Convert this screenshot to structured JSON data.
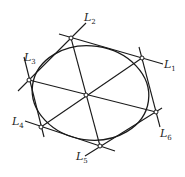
{
  "diagram": {
    "type": "brianchon-hexagon",
    "colors": {
      "line": "#1a1a1a",
      "background": "#ffffff",
      "vertex_fill": "#ffffff"
    },
    "ellipse": {
      "cx": 90.5,
      "cy": 93,
      "rx": 58.5,
      "ry": 47,
      "rotate": 8
    },
    "center": {
      "x": 86,
      "y": 95
    },
    "vertices": [
      {
        "id": "A",
        "x": 71,
        "y": 38
      },
      {
        "id": "B",
        "x": 142,
        "y": 58
      },
      {
        "id": "C",
        "x": 156,
        "y": 112
      },
      {
        "id": "D",
        "x": 100,
        "y": 146
      },
      {
        "id": "E",
        "x": 41,
        "y": 127
      },
      {
        "id": "F",
        "x": 29,
        "y": 80
      }
    ],
    "tangent_lines": [
      {
        "name": "L1",
        "x1": 59,
        "y1": 34,
        "x2": 163,
        "y2": 64
      },
      {
        "name": "L2",
        "x1": 18,
        "y1": 91,
        "x2": 86,
        "y2": 23
      },
      {
        "name": "L3",
        "x1": 24,
        "y1": 57,
        "x2": 44,
        "y2": 137
      },
      {
        "name": "L4",
        "x1": 25,
        "y1": 121,
        "x2": 115,
        "y2": 151
      },
      {
        "name": "L5",
        "x1": 85,
        "y1": 156,
        "x2": 162,
        "y2": 108
      },
      {
        "name": "L6",
        "x1": 139,
        "y1": 47,
        "x2": 160,
        "y2": 127
      }
    ],
    "diagonals": [
      {
        "x1": 71,
        "y1": 38,
        "x2": 100,
        "y2": 146
      },
      {
        "x1": 142,
        "y1": 58,
        "x2": 41,
        "y2": 127
      },
      {
        "x1": 29,
        "y1": 80,
        "x2": 156,
        "y2": 112
      }
    ],
    "labels": [
      {
        "main": "L",
        "sub": "1",
        "x": 164,
        "y": 68
      },
      {
        "main": "L",
        "sub": "2",
        "x": 84,
        "y": 21
      },
      {
        "main": "L",
        "sub": "3",
        "x": 24,
        "y": 61
      },
      {
        "main": "L",
        "sub": "4",
        "x": 12,
        "y": 125
      },
      {
        "main": "L",
        "sub": "5",
        "x": 76,
        "y": 160
      },
      {
        "main": "L",
        "sub": "6",
        "x": 160,
        "y": 137
      }
    ]
  }
}
